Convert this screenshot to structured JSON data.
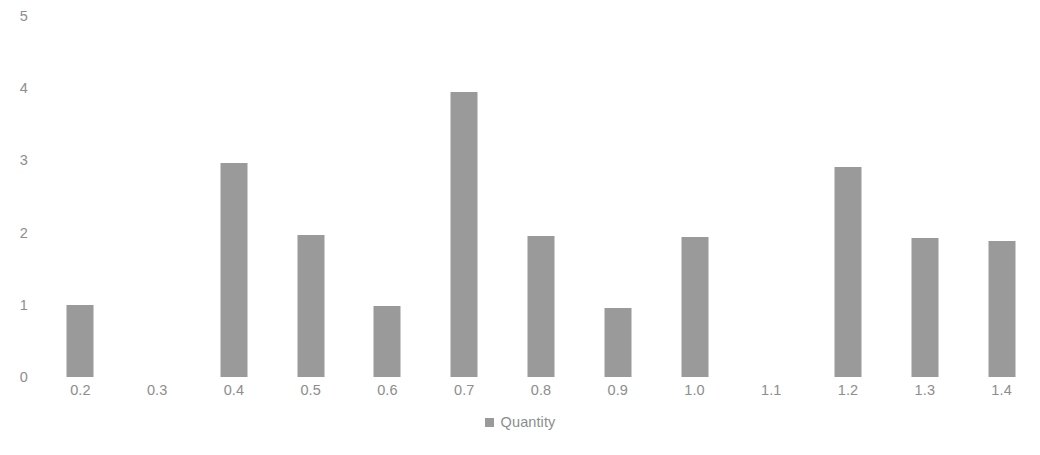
{
  "chart_data": {
    "type": "bar",
    "title": "",
    "subtitle": "",
    "xlabel": "",
    "ylabel": "",
    "categories": [
      "0.2",
      "0.3",
      "0.4",
      "0.5",
      "0.6",
      "0.7",
      "0.8",
      "0.9",
      "1.0",
      "1.1",
      "1.2",
      "1.3",
      "1.4"
    ],
    "values": [
      1.0,
      0,
      2.97,
      1.97,
      0.98,
      3.95,
      1.95,
      0.95,
      1.94,
      0,
      2.91,
      1.92,
      1.89
    ],
    "series": [
      {
        "name": "Quantity",
        "color": "#9a9a9a",
        "values": [
          1.0,
          0,
          2.97,
          1.97,
          0.98,
          3.95,
          1.95,
          0.95,
          1.94,
          0,
          2.91,
          1.92,
          1.89
        ]
      }
    ],
    "ylim": [
      0,
      5
    ],
    "y_ticks": [
      0,
      1,
      2,
      3,
      4,
      5
    ],
    "y_tick_labels": [
      "0",
      "1",
      "2",
      "3",
      "4",
      "5"
    ],
    "grid": false,
    "axis_line": false,
    "legend_position": "bottom-center",
    "legend": [
      {
        "label": "Quantity",
        "color": "#9a9a9a"
      }
    ],
    "annotations": []
  },
  "colors": {
    "background": "#ffffff",
    "bar": "#9a9a9a",
    "tick_text": "#8d8d8d",
    "legend_text": "#8d8d8d"
  }
}
